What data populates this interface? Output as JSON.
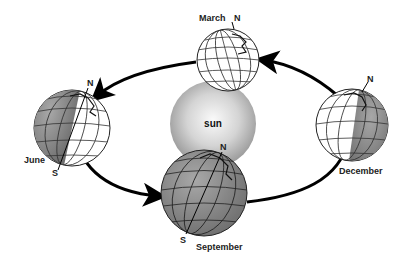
{
  "diagram": {
    "title": "",
    "center": {
      "label": "sun"
    },
    "globes": [
      {
        "id": "march",
        "label": "March",
        "north_label": "N",
        "south_label": ""
      },
      {
        "id": "june",
        "label": "June",
        "north_label": "N",
        "south_label": "S"
      },
      {
        "id": "september",
        "label": "September",
        "north_label": "N",
        "south_label": "S"
      },
      {
        "id": "december",
        "label": "December",
        "north_label": "N",
        "south_label": ""
      }
    ],
    "orbit_direction": "counterclockwise",
    "colors": {
      "sun_light": "#f4f4f4",
      "sun_dark": "#9a9a9a",
      "globe_dark": "#8a8a8a",
      "globe_light": "#ffffff",
      "grid": "#222222",
      "arrow": "#000000"
    }
  }
}
